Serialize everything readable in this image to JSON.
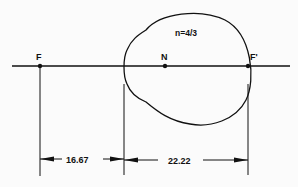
{
  "diagram": {
    "points": [
      {
        "id": "F",
        "label": "F",
        "x": 40
      },
      {
        "id": "N",
        "label": "N",
        "x": 165
      },
      {
        "id": "F_prime",
        "label": "F'",
        "x": 248
      }
    ],
    "refractive_index_label": "n=4/3",
    "dimensions": [
      {
        "id": "anterior_focal_length",
        "label": "16.67"
      },
      {
        "id": "posterior_focal_length",
        "label": "22.22"
      }
    ],
    "colors": {
      "line": "#111111",
      "background": "#fbfbfb"
    }
  }
}
